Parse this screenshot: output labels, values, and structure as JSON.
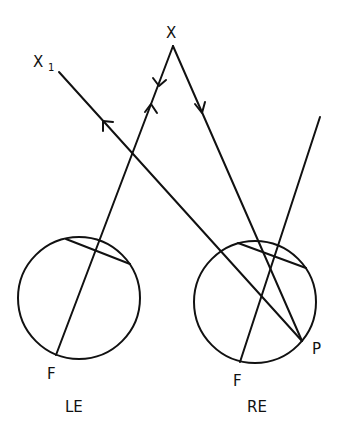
{
  "diagram": {
    "labels": {
      "x": "X",
      "x1_main": "X",
      "x1_sub": "1",
      "left_fovea": "F",
      "right_fovea": "F",
      "point_p": "P",
      "left_eye": "LE",
      "right_eye": "RE"
    },
    "eyes": [
      {
        "name": "LE",
        "cx": 79,
        "cy": 298,
        "r": 61
      },
      {
        "name": "RE",
        "cx": 255,
        "cy": 302,
        "r": 61
      }
    ],
    "colors": {
      "stroke": "#111111",
      "background": "#ffffff"
    }
  }
}
